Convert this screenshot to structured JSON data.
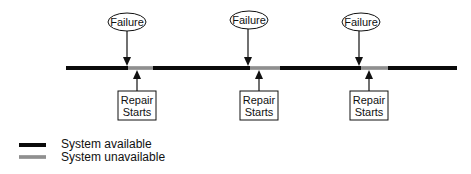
{
  "diagram": {
    "type": "timeline",
    "colors": {
      "available": "#0a0a0a",
      "unavailable": "#9a9a9a",
      "stroke": "#111111"
    },
    "timeline": {
      "x_start": 66,
      "x_end": 457,
      "y": 68
    },
    "events": [
      {
        "failure_label": "Failure",
        "repair_label_line1": "Repair",
        "repair_label_line2": "Starts",
        "failure_x": 127,
        "repair_x": 137,
        "unavailable_start": 128,
        "unavailable_end": 153
      },
      {
        "failure_label": "Failure",
        "repair_label_line1": "Repair",
        "repair_label_line2": "Starts",
        "failure_x": 248,
        "repair_x": 259,
        "unavailable_start": 250,
        "unavailable_end": 280
      },
      {
        "failure_label": "Failure",
        "repair_label_line1": "Repair",
        "repair_label_line2": "Starts",
        "failure_x": 360,
        "repair_x": 369,
        "unavailable_start": 361,
        "unavailable_end": 388
      }
    ]
  },
  "legend": {
    "items": [
      {
        "label": "System available",
        "style": "solid-black"
      },
      {
        "label": "System unavailable",
        "style": "gray-dashed"
      }
    ]
  }
}
